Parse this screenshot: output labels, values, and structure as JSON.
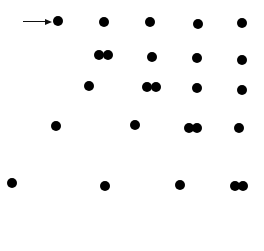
{
  "diagram": {
    "type": "dot-pattern",
    "width": 264,
    "height": 251,
    "dot_color": "#000000",
    "dot_diameter": 10,
    "arrow": {
      "x1": 23,
      "x2": 52,
      "y": 21,
      "points_to_dot": 0
    },
    "rows": [
      {
        "label": "row-1",
        "dots": [
          [
            58,
            21
          ],
          [
            104,
            22
          ],
          [
            150,
            22
          ],
          [
            198,
            24
          ],
          [
            242,
            23
          ]
        ]
      },
      {
        "label": "row-2",
        "dots": [
          [
            99,
            55
          ],
          [
            108,
            55
          ],
          [
            152,
            57
          ],
          [
            197,
            58
          ],
          [
            242,
            60
          ]
        ]
      },
      {
        "label": "row-3",
        "dots": [
          [
            89,
            86
          ],
          [
            147,
            87
          ],
          [
            156,
            87
          ],
          [
            197,
            88
          ],
          [
            242,
            90
          ]
        ]
      },
      {
        "label": "row-4",
        "dots": [
          [
            56,
            126
          ],
          [
            135,
            125
          ],
          [
            189,
            128
          ],
          [
            197,
            128
          ],
          [
            239,
            128
          ]
        ]
      },
      {
        "label": "row-5",
        "dots": [
          [
            12,
            183
          ],
          [
            105,
            186
          ],
          [
            180,
            185
          ],
          [
            235,
            186
          ],
          [
            243,
            186
          ]
        ]
      }
    ]
  }
}
